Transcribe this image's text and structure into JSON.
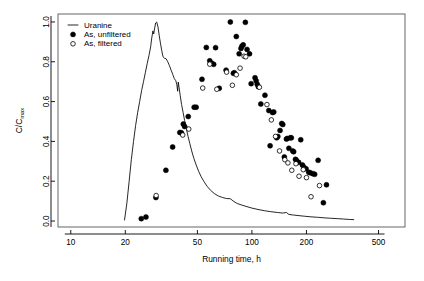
{
  "chart_data": {
    "type": "scatter",
    "title": "",
    "xlabel": "Running time, h",
    "ylabel": "C/Cmax",
    "ylabel_base": "C/C",
    "ylabel_sub": "max",
    "xscale": "log",
    "yscale": "linear",
    "xlim": [
      8.5,
      700
    ],
    "ylim": [
      -0.03,
      1.04
    ],
    "xticks": [
      10,
      20,
      50,
      100,
      200,
      500
    ],
    "xtick_labels": [
      "10",
      "20",
      "50",
      "100",
      "200",
      "500"
    ],
    "yticks": [
      0.0,
      0.2,
      0.4,
      0.6,
      0.8,
      1.0
    ],
    "ytick_labels": [
      "0.0",
      "0.2",
      "0.4",
      "0.6",
      "0.8",
      "1.0"
    ],
    "grid": false,
    "legend_position": "top-left",
    "legend": [
      {
        "label": "Uranine",
        "marker": "line"
      },
      {
        "label": "As, unfiltered",
        "marker": "filled-circle"
      },
      {
        "label": "As, filtered",
        "marker": "open-circle"
      }
    ],
    "series": [
      {
        "name": "Uranine",
        "type": "line",
        "marker": "line",
        "points": [
          [
            19.8,
            0.005
          ],
          [
            20.4,
            0.09
          ],
          [
            21.0,
            0.2
          ],
          [
            21.6,
            0.31
          ],
          [
            22.2,
            0.4
          ],
          [
            22.8,
            0.48
          ],
          [
            23.4,
            0.545
          ],
          [
            24.0,
            0.6
          ],
          [
            24.6,
            0.655
          ],
          [
            25.2,
            0.7
          ],
          [
            25.8,
            0.745
          ],
          [
            26.4,
            0.79
          ],
          [
            27.0,
            0.83
          ],
          [
            27.6,
            0.875
          ],
          [
            28.0,
            0.92
          ],
          [
            28.4,
            0.955
          ],
          [
            28.7,
            0.94
          ],
          [
            29.0,
            0.965
          ],
          [
            29.4,
            0.995
          ],
          [
            29.8,
            1.0
          ],
          [
            30.3,
            0.975
          ],
          [
            30.8,
            0.93
          ],
          [
            31.3,
            0.89
          ],
          [
            31.8,
            0.855
          ],
          [
            32.3,
            0.825
          ],
          [
            32.9,
            0.818
          ],
          [
            33.6,
            0.815
          ],
          [
            34.3,
            0.8
          ],
          [
            35.0,
            0.782
          ],
          [
            35.8,
            0.758
          ],
          [
            36.6,
            0.735
          ],
          [
            37.3,
            0.715
          ],
          [
            38.0,
            0.705
          ],
          [
            38.5,
            0.685
          ],
          [
            38.9,
            0.652
          ],
          [
            39.2,
            0.698
          ],
          [
            39.6,
            0.672
          ],
          [
            40.2,
            0.63
          ],
          [
            40.9,
            0.585
          ],
          [
            41.7,
            0.545
          ],
          [
            42.5,
            0.505
          ],
          [
            43.4,
            0.465
          ],
          [
            44.4,
            0.425
          ],
          [
            45.4,
            0.39
          ],
          [
            46.5,
            0.352
          ],
          [
            47.8,
            0.315
          ],
          [
            49.2,
            0.282
          ],
          [
            50.8,
            0.25
          ],
          [
            52.5,
            0.222
          ],
          [
            54.4,
            0.198
          ],
          [
            56.5,
            0.175
          ],
          [
            59.0,
            0.155
          ],
          [
            62.0,
            0.138
          ],
          [
            65.5,
            0.125
          ],
          [
            69.0,
            0.118
          ],
          [
            72.5,
            0.113
          ],
          [
            76.0,
            0.112
          ],
          [
            79.5,
            0.098
          ],
          [
            83.0,
            0.088
          ],
          [
            88.0,
            0.08
          ],
          [
            94.0,
            0.072
          ],
          [
            100.0,
            0.065
          ],
          [
            108.0,
            0.058
          ],
          [
            117.0,
            0.052
          ],
          [
            127.0,
            0.047
          ],
          [
            138.0,
            0.043
          ],
          [
            148.0,
            0.04
          ],
          [
            155.0,
            0.043
          ],
          [
            160.0,
            0.033
          ],
          [
            170.0,
            0.03
          ],
          [
            182.0,
            0.027
          ],
          [
            196.0,
            0.024
          ],
          [
            212.0,
            0.021
          ],
          [
            230.0,
            0.019
          ],
          [
            250.0,
            0.016
          ],
          [
            272.0,
            0.014
          ],
          [
            296.0,
            0.012
          ],
          [
            320.0,
            0.01
          ],
          [
            345.0,
            0.008
          ],
          [
            365.0,
            0.007
          ]
        ]
      },
      {
        "name": "As, unfiltered",
        "type": "scatter",
        "marker": "filled-circle",
        "points": [
          [
            24.5,
            0.012
          ],
          [
            26.0,
            0.02
          ],
          [
            29.5,
            0.118
          ],
          [
            33.5,
            0.255
          ],
          [
            36.5,
            0.372
          ],
          [
            40.0,
            0.445
          ],
          [
            40.8,
            0.443
          ],
          [
            41.8,
            0.487
          ],
          [
            42.5,
            0.475
          ],
          [
            44.5,
            0.525
          ],
          [
            48.0,
            0.572
          ],
          [
            49.2,
            0.572
          ],
          [
            53.0,
            0.712
          ],
          [
            56.0,
            0.872
          ],
          [
            58.5,
            0.805
          ],
          [
            60.0,
            0.793
          ],
          [
            61.5,
            0.787
          ],
          [
            63.0,
            0.871
          ],
          [
            66.0,
            0.667
          ],
          [
            72.0,
            0.758
          ],
          [
            76.0,
            1.0
          ],
          [
            79.0,
            0.742
          ],
          [
            80.0,
            0.745
          ],
          [
            82.0,
            0.927
          ],
          [
            85.0,
            0.84
          ],
          [
            87.0,
            0.867
          ],
          [
            88.0,
            0.878
          ],
          [
            89.5,
            0.885
          ],
          [
            92.0,
            0.998
          ],
          [
            94.0,
            0.862
          ],
          [
            97.0,
            0.84
          ],
          [
            99.0,
            0.69
          ],
          [
            104.0,
            0.72
          ],
          [
            105.5,
            0.705
          ],
          [
            107.0,
            0.687
          ],
          [
            108.5,
            0.675
          ],
          [
            112.0,
            0.588
          ],
          [
            118.0,
            0.632
          ],
          [
            124.0,
            0.555
          ],
          [
            126.0,
            0.378
          ],
          [
            130.0,
            0.545
          ],
          [
            132.0,
            0.548
          ],
          [
            137.0,
            0.418
          ],
          [
            139.0,
            0.425
          ],
          [
            143.0,
            0.455
          ],
          [
            146.0,
            0.49
          ],
          [
            148.0,
            0.485
          ],
          [
            151.0,
            0.322
          ],
          [
            155.0,
            0.412
          ],
          [
            157.0,
            0.415
          ],
          [
            160.0,
            0.365
          ],
          [
            163.0,
            0.418
          ],
          [
            165.0,
            0.418
          ],
          [
            168.0,
            0.352
          ],
          [
            170.0,
            0.348
          ],
          [
            174.0,
            0.31
          ],
          [
            176.0,
            0.305
          ],
          [
            181.0,
            0.295
          ],
          [
            186.0,
            0.408
          ],
          [
            190.0,
            0.282
          ],
          [
            193.0,
            0.272
          ],
          [
            199.0,
            0.262
          ],
          [
            206.0,
            0.245
          ],
          [
            210.0,
            0.242
          ],
          [
            217.0,
            0.238
          ],
          [
            222.0,
            0.235
          ],
          [
            232.0,
            0.305
          ],
          [
            258.0,
            0.182
          ],
          [
            248.0,
            0.092
          ]
        ]
      },
      {
        "name": "As, filtered",
        "type": "scatter",
        "marker": "open-circle",
        "points": [
          [
            29.6,
            0.128
          ],
          [
            41.5,
            0.432
          ],
          [
            44.8,
            0.462
          ],
          [
            53.5,
            0.668
          ],
          [
            58.5,
            0.788
          ],
          [
            64.0,
            0.662
          ],
          [
            72.5,
            0.748
          ],
          [
            78.0,
            0.682
          ],
          [
            82.0,
            0.735
          ],
          [
            86.0,
            0.768
          ],
          [
            90.5,
            0.828
          ],
          [
            92.5,
            0.825
          ],
          [
            110.0,
            0.672
          ],
          [
            121.0,
            0.585
          ],
          [
            128.0,
            0.508
          ],
          [
            135.0,
            0.425
          ],
          [
            142.0,
            0.352
          ],
          [
            152.0,
            0.308
          ],
          [
            158.0,
            0.292
          ],
          [
            166.0,
            0.255
          ],
          [
            175.0,
            0.288
          ],
          [
            182.0,
            0.225
          ],
          [
            192.0,
            0.258
          ],
          [
            200.0,
            0.218
          ],
          [
            212.0,
            0.122
          ],
          [
            236.0,
            0.178
          ]
        ]
      }
    ]
  },
  "axes": {
    "x_title": "Running time, h",
    "y_title_base": "C/C",
    "y_title_sub": "max"
  }
}
